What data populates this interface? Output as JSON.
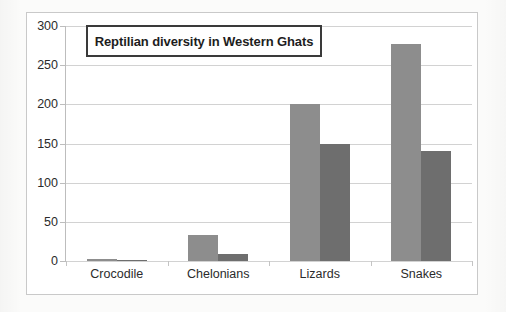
{
  "chart_data": {
    "type": "bar",
    "title": "Reptilian diversity in Western Ghats",
    "xlabel": "",
    "ylabel": "",
    "categories": [
      "Crocodile",
      "Chelonians",
      "Lizards",
      "Snakes"
    ],
    "series": [
      {
        "name": "series-a",
        "color": "#8d8d8d",
        "values": [
          3,
          33,
          200,
          277
        ]
      },
      {
        "name": "series-b",
        "color": "#6e6e6e",
        "values": [
          1,
          9,
          150,
          140
        ]
      }
    ],
    "ylim": [
      0,
      300
    ],
    "yticks": [
      0,
      50,
      100,
      150,
      200,
      250,
      300
    ],
    "ytick_labels": [
      "0",
      "50",
      "100",
      "150",
      "200",
      "250",
      "300"
    ],
    "grid": true,
    "grid_axis": "y",
    "legend": false,
    "legend_position": "none"
  },
  "frame": {
    "border_color": "#c9c9c9"
  }
}
